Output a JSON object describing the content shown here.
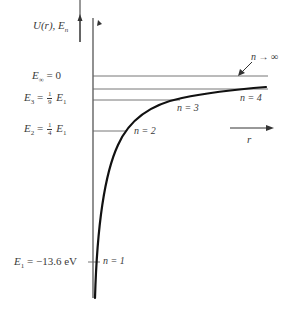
{
  "diagram": {
    "y_axis_label": "U(r), E_n",
    "y_axis_label_parts": {
      "main": "U(r), E",
      "sub": "n"
    },
    "x_axis_label": "r",
    "levels": [
      {
        "id": "E_inf",
        "label_main": "E",
        "label_sub": "∞",
        "label_rhs": "= 0",
        "y": 76,
        "x_end": 268
      },
      {
        "id": "E_4",
        "n_label": "n = 4",
        "y": 89,
        "x_end": 268
      },
      {
        "id": "E_3",
        "label_main": "E",
        "label_sub": "3",
        "label_eq": "=",
        "frac_num": "1",
        "frac_den": "9",
        "label_tail": "E",
        "tail_sub": "1",
        "n_label": "n = 3",
        "y": 100,
        "x_end": 180
      },
      {
        "id": "E_2",
        "label_main": "E",
        "label_sub": "2",
        "label_eq": "=",
        "frac_num": "1",
        "frac_den": "4",
        "label_tail": "E",
        "tail_sub": "1",
        "n_label": "n = 2",
        "y": 131,
        "x_end": 126
      },
      {
        "id": "E_1",
        "label_main": "E",
        "label_sub": "1",
        "label_rhs": "= −13.6 eV",
        "n_label": "n = 1",
        "y": 262,
        "x_end": 100
      }
    ],
    "annotations": {
      "n_infinity": "n → ∞"
    },
    "colors": {
      "ink": "#333333",
      "curve": "#111111",
      "background": "#ffffff"
    }
  }
}
